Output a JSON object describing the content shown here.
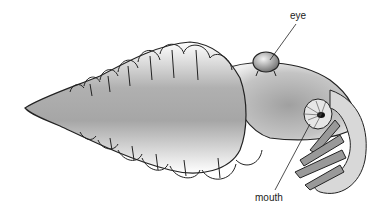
{
  "figure": {
    "labels": {
      "eye": "eye",
      "mouth": "mouth"
    },
    "colors": {
      "outline": "#222222",
      "body_shade": "#a8a8a8",
      "background": "#ffffff"
    }
  }
}
